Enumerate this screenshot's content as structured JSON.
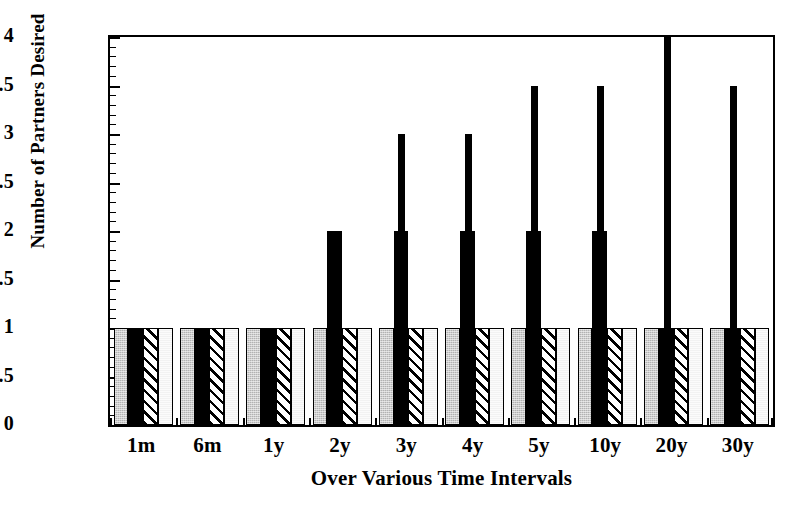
{
  "chart_data": {
    "type": "bar",
    "title": "",
    "xlabel": "Over Various Time Intervals",
    "ylabel": "Number of Partners Desired",
    "categories": [
      "1m",
      "6m",
      "1y",
      "2y",
      "3y",
      "4y",
      "5y",
      "10y",
      "20y",
      "30y"
    ],
    "ylim": [
      0,
      4
    ],
    "yticks": [
      0,
      0.5,
      1,
      1.5,
      2,
      2.5,
      3,
      3.5,
      4
    ],
    "ytick_labels": [
      "0",
      "0.5",
      "1",
      "1.5",
      "2",
      "2.5",
      "3",
      "3.5",
      "4"
    ],
    "minor_tick_step": 0.1,
    "grid": false,
    "legend": "none",
    "series": [
      {
        "name": "Series 1 (stippled gray)",
        "pattern": "stipple-gray",
        "color": "#b2b2b2",
        "values": [
          1,
          1,
          1,
          1,
          1,
          1,
          1,
          1,
          1,
          1
        ]
      },
      {
        "name": "Series 2 (solid black)",
        "pattern": "solid-black",
        "color": "#000000",
        "values": [
          1,
          1,
          1,
          2,
          2,
          2,
          2,
          2,
          1,
          1
        ]
      },
      {
        "name": "Series 3 (diagonal hatch)",
        "pattern": "diagonal-hatch",
        "color": "#ffffff",
        "values": [
          1,
          1,
          1,
          1,
          1,
          1,
          1,
          1,
          1,
          1
        ]
      },
      {
        "name": "Series 4 (light gray)",
        "pattern": "light-gray",
        "color": "#f2f2f2",
        "values": [
          1,
          1,
          1,
          1,
          1,
          1,
          1,
          1,
          1,
          1
        ]
      },
      {
        "name": "Series 5 (narrow black maximum)",
        "pattern": "solid-black-narrow",
        "color": "#000000",
        "values": [
          1,
          1,
          1,
          2,
          3,
          3,
          3.5,
          3.5,
          4,
          3.5
        ]
      }
    ]
  }
}
